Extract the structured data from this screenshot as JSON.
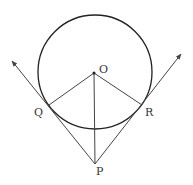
{
  "diagram": {
    "labels": {
      "center": "O",
      "tangent_point_left": "Q",
      "tangent_point_right": "R",
      "external_point": "P"
    },
    "colors": {
      "circle": "#222222",
      "lines": "#444444",
      "text": "#333333"
    }
  }
}
